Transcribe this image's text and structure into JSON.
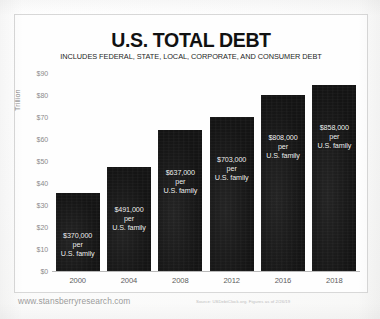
{
  "chart_data": {
    "type": "bar",
    "title": "U.S. TOTAL DEBT",
    "subtitle": "INCLUDES FEDERAL, STATE, LOCAL, CORPORATE, AND CONSUMER DEBT",
    "xlabel": "",
    "ylabel": "Trillion",
    "ylim": [
      0,
      90
    ],
    "grid": false,
    "legend": "none",
    "categories": [
      "2000",
      "2004",
      "2008",
      "2012",
      "2016",
      "2018"
    ],
    "values": [
      35.5,
      47.5,
      64,
      70,
      80,
      84.5
    ],
    "ytick_labels": [
      "$90",
      "$80",
      "$70",
      "$60",
      "$50",
      "$40",
      "$30",
      "$20",
      "$10",
      "$0"
    ],
    "ytick_values": [
      90,
      80,
      70,
      60,
      50,
      40,
      30,
      20,
      10,
      0
    ],
    "bar_color": "#161616",
    "annotations": [
      "$370,000 per\nU.S. family",
      "$491,000 per\nU.S. family",
      "$637,000 per\nU.S. family",
      "$703,000 per\nU.S. family",
      "$808,000 per\nU.S. family",
      "$858,000  per\nU.S. family"
    ],
    "annotation_lines": [
      {
        "line1": "$370,000 per",
        "line2": "U.S. family"
      },
      {
        "line1": "$491,000 per",
        "line2": "U.S. family"
      },
      {
        "line1": "$637,000 per",
        "line2": "U.S. family"
      },
      {
        "line1": "$703,000 per",
        "line2": "U.S. family"
      },
      {
        "line1": "$808,000 per",
        "line2": "U.S. family"
      },
      {
        "line1": "$858,000  per",
        "line2": "U.S. family"
      }
    ]
  },
  "footer": {
    "site_url": "www.stansberryresearch.com",
    "source": "Source: USDebtClock.org. Figures as of 2/26/19"
  }
}
